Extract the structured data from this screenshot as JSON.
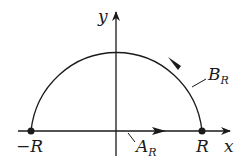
{
  "diagram": {
    "type": "semicircular contour",
    "axes": {
      "x_label": "x",
      "y_label": "y"
    },
    "points": [
      {
        "label": "−R",
        "position": "left endpoint on x-axis"
      },
      {
        "label": "R",
        "position": "right endpoint on x-axis"
      }
    ],
    "paths": [
      {
        "name": "A",
        "subscript": "R",
        "description": "segment along real axis from −R to R, arrow pointing right"
      },
      {
        "name": "B",
        "subscript": "R",
        "description": "upper semicircular arc from R to −R, arrow counterclockwise"
      }
    ],
    "colors": {
      "stroke": "#1a1a1a",
      "background": "#ffffff"
    }
  }
}
